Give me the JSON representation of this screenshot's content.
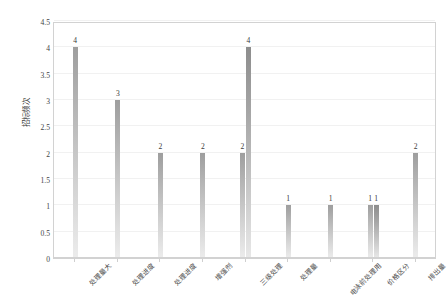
{
  "chart_data": {
    "type": "bar",
    "title": "",
    "xlabel": "",
    "ylabel": "招标频次",
    "ylim": [
      0,
      4.5
    ],
    "ytick_labels": [
      "0",
      "0.5",
      "1",
      "1.5",
      "2",
      "2.5",
      "3",
      "3.5",
      "4",
      "4.5"
    ],
    "ytick_values": [
      0,
      0.5,
      1,
      1.5,
      2,
      2.5,
      3,
      3.5,
      4,
      4.5
    ],
    "grid": true,
    "legend": "none",
    "categories": [
      "处理量大",
      "处理进度",
      "处理进度",
      "增强剂",
      "三级处理",
      "处理量",
      "电泳前处理用",
      "价格区分",
      "排出量"
    ],
    "series": [
      {
        "name": "series-1",
        "values": [
          4,
          3,
          2,
          2,
          2,
          1,
          1,
          1,
          2
        ],
        "labels": [
          "4",
          "3",
          "2",
          "2",
          "2",
          "1",
          "1",
          "1",
          "2"
        ]
      },
      {
        "name": "series-2",
        "values": [
          null,
          null,
          null,
          null,
          4,
          null,
          null,
          1,
          null
        ],
        "labels": [
          "",
          "",
          "",
          "",
          "4",
          "",
          "",
          "1",
          ""
        ]
      }
    ]
  },
  "colors": {
    "bar_top": "#9e9e9e",
    "bar_bottom": "#ececec",
    "grid": "#f1f1f1",
    "axis": "#d2d2d2",
    "text": "#3b3b3b",
    "background": "#ffffff"
  }
}
